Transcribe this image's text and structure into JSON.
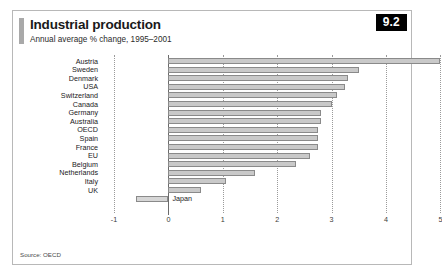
{
  "figure": {
    "number": "9.2",
    "title": "Industrial production",
    "subtitle": "Annual average % change, 1995–2001",
    "source": "Source: OECD"
  },
  "chart_data": {
    "type": "bar",
    "orientation": "horizontal",
    "title": "Industrial production",
    "subtitle": "Annual average % change, 1995–2001",
    "xlabel": "",
    "ylabel": "",
    "xlim": [
      -1,
      5
    ],
    "xticks": [
      "-1",
      "0",
      "1",
      "2",
      "3",
      "4",
      "5"
    ],
    "xtick_values": [
      -1,
      0,
      1,
      2,
      3,
      4,
      5
    ],
    "grid": "vertical-dotted",
    "legend": "none",
    "source": "Source: OECD",
    "categories": [
      "Austria",
      "Sweden",
      "Denmark",
      "USA",
      "Switzerland",
      "Canada",
      "Germany",
      "Australia",
      "OECD",
      "Spain",
      "France",
      "EU",
      "Belgium",
      "Netherlands",
      "Italy",
      "UK",
      "Japan"
    ],
    "values": [
      5.0,
      3.5,
      3.3,
      3.25,
      3.1,
      3.0,
      2.8,
      2.8,
      2.75,
      2.75,
      2.75,
      2.6,
      2.35,
      1.6,
      1.05,
      0.6,
      -0.6
    ],
    "bars": [
      {
        "label": "Austria",
        "value": 5.0,
        "label_side": "left"
      },
      {
        "label": "Sweden",
        "value": 3.5,
        "label_side": "left"
      },
      {
        "label": "Denmark",
        "value": 3.3,
        "label_side": "left"
      },
      {
        "label": "USA",
        "value": 3.25,
        "label_side": "left"
      },
      {
        "label": "Switzerland",
        "value": 3.1,
        "label_side": "left"
      },
      {
        "label": "Canada",
        "value": 3.0,
        "label_side": "left"
      },
      {
        "label": "Germany",
        "value": 2.8,
        "label_side": "left"
      },
      {
        "label": "Australia",
        "value": 2.8,
        "label_side": "left"
      },
      {
        "label": "OECD",
        "value": 2.75,
        "label_side": "left"
      },
      {
        "label": "Spain",
        "value": 2.75,
        "label_side": "left"
      },
      {
        "label": "France",
        "value": 2.75,
        "label_side": "left"
      },
      {
        "label": "EU",
        "value": 2.6,
        "label_side": "left"
      },
      {
        "label": "Belgium",
        "value": 2.35,
        "label_side": "left"
      },
      {
        "label": "Netherlands",
        "value": 1.6,
        "label_side": "left"
      },
      {
        "label": "Italy",
        "value": 1.05,
        "label_side": "left"
      },
      {
        "label": "UK",
        "value": 0.6,
        "label_side": "left"
      },
      {
        "label": "Japan",
        "value": -0.6,
        "label_side": "right"
      }
    ],
    "colors": {
      "bar_fill": "#c9c9c9",
      "bar_border": "#8a8a8a",
      "gridline": "#9a9a9a",
      "axis": "#6b6b6b",
      "badge_bg": "#000000",
      "badge_text": "#ffffff",
      "frame": "#b8b8b8"
    }
  }
}
